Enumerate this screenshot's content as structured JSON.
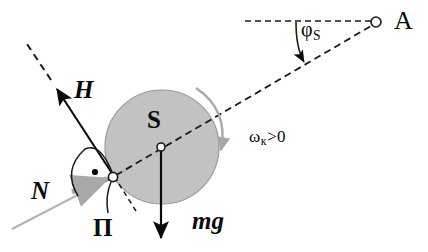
{
  "figure": {
    "background_color": "#ffffff",
    "ink_color": "#0a0a0a",
    "disk_fill_color": "#c2c2c2",
    "disk_edge_color": "#8a8a8a",
    "accent_gray_color": "#a8a8a8"
  },
  "labels": {
    "force_H": "H",
    "center_S": "S",
    "force_N": "N",
    "contact_point": "П",
    "weight_mg": "mg",
    "point_A": "A",
    "angle_phi": "φ",
    "angle_phi_sub": "S",
    "omega": "ω",
    "omega_sub": "к",
    "omega_condition": ">0"
  },
  "elements": {
    "disk": {
      "name": "gray-disk",
      "center_x": 162,
      "center_y": 147,
      "radius": 57
    },
    "center_marker": {
      "name": "disk-center-marker",
      "x": 161,
      "y": 147
    },
    "contact_marker": {
      "name": "contact-point-marker",
      "x": 113,
      "y": 177
    },
    "point_a_marker": {
      "name": "point-a-marker",
      "x": 376,
      "y": 22
    },
    "incline_line": {
      "name": "incline-surface-line",
      "x1": 14,
      "y1": 228,
      "x2": 124,
      "y2": 171
    },
    "axis_dashed": {
      "name": "disk-axis-dashed-line",
      "x1": 107,
      "y1": 180,
      "x2": 372,
      "y2": 26
    },
    "horizontal_dashed": {
      "name": "horizontal-reference-dashed-line",
      "x1": 245,
      "y1": 21,
      "x2": 373,
      "y2": 21
    },
    "force_h_arrow": {
      "name": "force-h-arrow",
      "x1": 116,
      "y1": 180,
      "x2": 54,
      "y2": 85
    },
    "force_h_dashed_extension": {
      "name": "force-h-dashed-extension",
      "x1": 50,
      "y1": 79,
      "x2": 28,
      "y2": 45
    },
    "force_n_arrow": {
      "name": "force-n-arrow",
      "x1": 74,
      "y1": 190,
      "x2": 110,
      "y2": 178
    },
    "weight_arrow": {
      "name": "weight-mg-arrow",
      "x1": 161,
      "y1": 148,
      "x2": 161,
      "y2": 240
    },
    "rotation_arc": {
      "name": "rotation-direction-arc",
      "sweep": "clockwise"
    },
    "angle_arc_contact": {
      "name": "contact-angle-arc"
    },
    "angle_dot": {
      "name": "contact-angle-dot",
      "x": 94,
      "y": 173
    },
    "pi_leader": {
      "name": "pi-leader-line"
    },
    "contact_dashed_stub": {
      "name": "contact-dashed-stub"
    },
    "phi_arc": {
      "name": "phi-angle-arc-arrow"
    }
  }
}
